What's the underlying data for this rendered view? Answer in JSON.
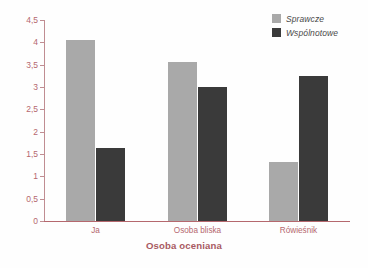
{
  "chart_data": {
    "type": "bar",
    "title": "",
    "subtitle": "",
    "xlabel": "Osoba oceniana",
    "ylabel": "",
    "categories": [
      "Ja",
      "Osoba bliska",
      "Rówieśnik"
    ],
    "series": [
      {
        "name": "Sprawcze",
        "color": "#a9a9a9",
        "values": [
          4.05,
          3.56,
          1.33
        ]
      },
      {
        "name": "Wspólnotowe",
        "color": "#3a3a3a",
        "values": [
          1.63,
          2.99,
          3.25
        ]
      }
    ],
    "ylim": [
      0,
      4.5
    ],
    "ytick_values": [
      0,
      0.5,
      1,
      1.5,
      2,
      2.5,
      3,
      3.5,
      4,
      4.5
    ],
    "ytick_labels": [
      "0",
      "0,5",
      "1",
      "1,5",
      "2",
      "2,5",
      "3",
      "3,5",
      "4",
      "4,5"
    ],
    "grid": false,
    "legend_position": "top-right",
    "annotations": []
  },
  "legend": {
    "items": [
      {
        "label": "Sprawcze",
        "color": "#a9a9a9"
      },
      {
        "label": "Wspólnotowe",
        "color": "#3a3a3a"
      }
    ]
  },
  "axes": {
    "x_title": "Osoba oceniana",
    "axis_color": "#b5686e",
    "tick_label_color": "#b5686e"
  }
}
